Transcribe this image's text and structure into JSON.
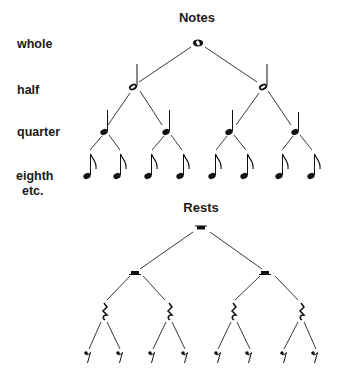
{
  "notes": {
    "title": "Notes",
    "levels": [
      {
        "label": "whole",
        "count": 1
      },
      {
        "label": "half",
        "count": 2
      },
      {
        "label": "quarter",
        "count": 4
      },
      {
        "label": "eighth",
        "count": 8
      }
    ],
    "etc_label": "etc."
  },
  "rests": {
    "title": "Rests",
    "levels": [
      {
        "name": "whole rest",
        "count": 1
      },
      {
        "name": "half rest",
        "count": 2
      },
      {
        "name": "quarter rest",
        "count": 4
      },
      {
        "name": "eighth rest",
        "count": 8
      }
    ]
  },
  "colors": {
    "ink": "#111111",
    "background": "#ffffff"
  }
}
